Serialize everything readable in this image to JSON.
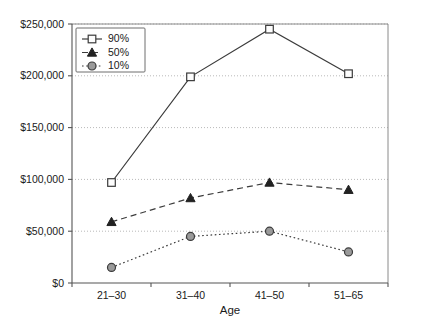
{
  "chart_data": {
    "type": "line",
    "title": "",
    "xlabel": "Age",
    "ylabel": "",
    "categories": [
      "21–30",
      "31–40",
      "41–50",
      "51–65"
    ],
    "ylim": [
      0,
      250000
    ],
    "ytick_values": [
      0,
      50000,
      100000,
      150000,
      200000,
      250000
    ],
    "ytick_labels": [
      "$0",
      "$50,000",
      "$100,000",
      "$150,000",
      "$200,000",
      "$250,000"
    ],
    "grid": true,
    "legend_position": "upper left",
    "series": [
      {
        "name": "90%",
        "values": [
          97000,
          199000,
          245000,
          202000
        ],
        "marker": "square",
        "linestyle": "solid",
        "color": "#3b3b3b",
        "marker_fill": "#fdfdfd"
      },
      {
        "name": "50%",
        "values": [
          59000,
          82000,
          97000,
          90000
        ],
        "marker": "triangle",
        "linestyle": "dashed",
        "color": "#3b3b3b",
        "marker_fill": "#222222"
      },
      {
        "name": "10%",
        "values": [
          15000,
          45000,
          50000,
          30000
        ],
        "marker": "circle",
        "linestyle": "dotted",
        "color": "#3b3b3b",
        "marker_fill": "#9a9a9a"
      }
    ]
  },
  "axis": {
    "x_title": "Age",
    "y_tick_0": "$0",
    "y_tick_1": "$50,000",
    "y_tick_2": "$100,000",
    "y_tick_3": "$150,000",
    "y_tick_4": "$200,000",
    "y_tick_5": "$250,000",
    "x_tick_0": "21–30",
    "x_tick_1": "31–40",
    "x_tick_2": "41–50",
    "x_tick_3": "51–65"
  },
  "legend": {
    "item_0": "90%",
    "item_1": "50%",
    "item_2": "10%"
  },
  "colors": {
    "line": "#3b3b3b",
    "grid": "#b9b9b9",
    "axis": "#555555",
    "text": "#1a1a1a",
    "circle_fill": "#9a9a9a",
    "square_fill": "#fdfdfd",
    "triangle_fill": "#222222"
  }
}
